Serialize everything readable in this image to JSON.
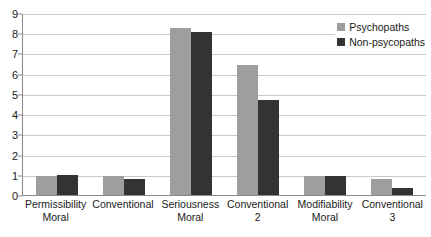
{
  "chart_data": {
    "type": "bar",
    "title": "",
    "subtitle": "",
    "xlabel": "",
    "ylabel": "",
    "ylim": [
      0,
      9
    ],
    "ytick_labels": [
      "0",
      "1",
      "2",
      "3",
      "4",
      "5",
      "6",
      "7",
      "8",
      "9"
    ],
    "ytick_values": [
      0,
      1,
      2,
      3,
      4,
      5,
      6,
      7,
      8,
      9
    ],
    "grid": true,
    "legend_position": "top-right",
    "categories": [
      "Permissibility Moral",
      "Conventional",
      "Seriousness Moral",
      "Conventional 2",
      "Modifiability Moral",
      "Conventional 3"
    ],
    "category_lines": [
      [
        "Permissibility",
        "Moral"
      ],
      [
        "Conventional",
        ""
      ],
      [
        "Seriousness",
        "Moral"
      ],
      [
        "Conventional",
        "2"
      ],
      [
        "Modifiability",
        "Moral"
      ],
      [
        "Conventional",
        "3"
      ]
    ],
    "series": [
      {
        "name": "Psychopaths",
        "color": "#9e9e9e",
        "values": [
          1.0,
          1.0,
          8.3,
          6.5,
          1.0,
          0.85
        ]
      },
      {
        "name": "Non-psycopaths",
        "color": "#333333",
        "values": [
          1.05,
          0.85,
          8.1,
          4.75,
          1.0,
          0.4
        ]
      }
    ]
  },
  "legend": {
    "items": [
      {
        "label": "Psychopaths",
        "color": "#9e9e9e"
      },
      {
        "label": "Non-psycopaths",
        "color": "#333333"
      }
    ]
  },
  "colors": {
    "series_light": "#9e9e9e",
    "series_dark": "#333333",
    "gridline": "#c9c9c9",
    "axis": "#8a8a8a",
    "text": "#1a1a1a",
    "background": "#ffffff"
  }
}
